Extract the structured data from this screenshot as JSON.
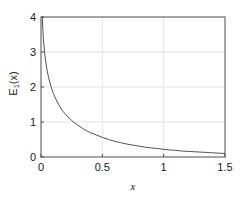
{
  "chart_data": {
    "type": "line",
    "title": "",
    "subtitle": "",
    "xlabel": "x",
    "ylabel": "E₁(x)",
    "ylabel_base": "E",
    "ylabel_sub": "1",
    "ylabel_tail": "(x)",
    "xlim": [
      0,
      1.5
    ],
    "ylim": [
      0,
      4
    ],
    "grid": true,
    "legend": null,
    "legend_position": "none",
    "xticks": [
      0,
      0.5,
      1,
      1.5
    ],
    "xtick_labels": [
      "0",
      "0.5",
      "1",
      "1.5"
    ],
    "yticks": [
      0,
      1,
      2,
      3,
      4
    ],
    "ytick_labels": [
      "0",
      "1",
      "2",
      "3",
      "4"
    ],
    "x_gridlines": [
      0.5,
      1
    ],
    "y_gridlines": [
      1,
      2,
      3
    ],
    "series": [
      {
        "name": "E1(x)",
        "color": "#404040",
        "linewidth": 0.9,
        "x": [
          0.004,
          0.01,
          0.015,
          0.02,
          0.03,
          0.04,
          0.05,
          0.06,
          0.08,
          0.1,
          0.12,
          0.15,
          0.18,
          0.2,
          0.25,
          0.3,
          0.35,
          0.4,
          0.45,
          0.5,
          0.55,
          0.6,
          0.65,
          0.7,
          0.75,
          0.8,
          0.85,
          0.9,
          0.95,
          1.0,
          1.05,
          1.1,
          1.15,
          1.2,
          1.25,
          1.3,
          1.35,
          1.4,
          1.45,
          1.5
        ],
        "y": [
          4.94,
          4.04,
          3.64,
          3.35,
          2.96,
          2.68,
          2.47,
          2.3,
          2.03,
          1.82,
          1.66,
          1.46,
          1.3,
          1.22,
          1.04,
          0.91,
          0.79,
          0.7,
          0.63,
          0.56,
          0.5,
          0.45,
          0.41,
          0.37,
          0.34,
          0.31,
          0.28,
          0.26,
          0.24,
          0.22,
          0.2,
          0.19,
          0.17,
          0.16,
          0.15,
          0.14,
          0.13,
          0.12,
          0.11,
          0.1
        ]
      }
    ]
  },
  "style": {
    "background": "#ffffff",
    "axis_color": "#4d4d4d",
    "grid_color": "#e3e3e3",
    "text_color": "#1a1a1a",
    "curve_color": "#404040"
  },
  "geometry": {
    "left": 41,
    "right": 225,
    "top": 17,
    "bottom": 157
  }
}
